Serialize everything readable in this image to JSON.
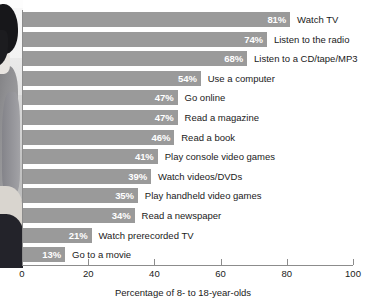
{
  "chart_data": {
    "type": "bar",
    "orientation": "horizontal",
    "title": "",
    "xlabel": "Percentage of 8- to 18-year-olds",
    "ylabel": "",
    "xlim": [
      0,
      100
    ],
    "grid": false,
    "legend": null,
    "categories": [
      "Watch TV",
      "Listen to the radio",
      "Listen to a CD/tape/MP3",
      "Use a computer",
      "Go online",
      "Read a magazine",
      "Read a book",
      "Play console video games",
      "Watch videos/DVDs",
      "Play handheld video games",
      "Read a newspaper",
      "Watch prerecorded TV",
      "Go to a movie"
    ],
    "values": [
      81,
      74,
      68,
      54,
      47,
      47,
      46,
      41,
      39,
      35,
      34,
      21,
      13
    ],
    "value_labels": [
      "81%",
      "74%",
      "68%",
      "54%",
      "47%",
      "47%",
      "46%",
      "41%",
      "39%",
      "35%",
      "34%",
      "21%",
      "13%"
    ],
    "xticks": [
      0,
      20,
      40,
      60,
      80,
      100
    ],
    "xtick_labels": [
      "0",
      "20",
      "40",
      "60",
      "80",
      "100"
    ],
    "bar_color": "#9a9a9a",
    "value_label_color": "#ffffff",
    "category_label_color": "#1a1a1a",
    "axis_color": "#8c8c8c"
  },
  "decoration": {
    "photo_alt": "photograph of a person seated, cropped at left edge"
  }
}
